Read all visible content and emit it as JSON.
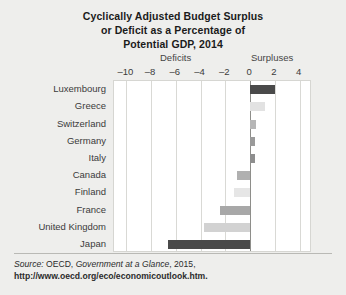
{
  "title": {
    "line1": "Cyclically Adjusted Budget Surplus",
    "line2": "or Deficit as a Percentage of",
    "line3": "Potential GDP, 2014"
  },
  "headers": {
    "deficits": "Deficits",
    "surpluses": "Surpluses"
  },
  "source": {
    "lead": "Source:",
    "org": " OECD, ",
    "publication": "Government at a Glance",
    "year": ", 2015, ",
    "url": "http://www.oecd.org/eco/economicoutlook.htm."
  },
  "chart_data": {
    "type": "bar",
    "orientation": "horizontal",
    "title": "Cyclically Adjusted Budget Surplus or Deficit as a Percentage of Potential GDP, 2014",
    "xlabel": "",
    "ylabel": "",
    "xlim": [
      -11,
      5
    ],
    "ticks": [
      -10,
      -8,
      -6,
      -4,
      -2,
      0,
      2,
      4
    ],
    "tick_labels": [
      "–10",
      "–8",
      "–6",
      "–4",
      "–2",
      "0",
      "2",
      "4"
    ],
    "grid": true,
    "legend": false,
    "categories": [
      "Luxembourg",
      "Greece",
      "Switzerland",
      "Germany",
      "Italy",
      "Canada",
      "Finland",
      "France",
      "United Kingdom",
      "Japan"
    ],
    "values": [
      2.0,
      1.2,
      0.5,
      0.4,
      0.4,
      -1.1,
      -1.3,
      -2.4,
      -3.7,
      -6.6
    ],
    "colors": [
      "#4a4a4a",
      "#e2e2e2",
      "#b6b6b6",
      "#9a9a9a",
      "#8e8e8e",
      "#b0b0b0",
      "#e6e6e6",
      "#a8a8a8",
      "#d2d2d2",
      "#4a4a4a"
    ]
  }
}
